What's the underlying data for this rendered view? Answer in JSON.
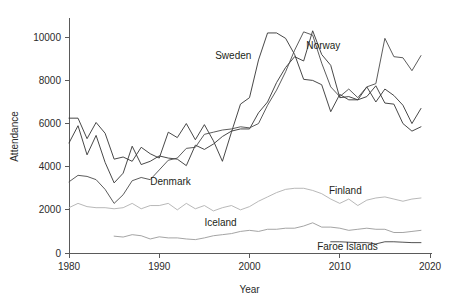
{
  "chart_data": {
    "type": "line",
    "title": "",
    "xlabel": "Year",
    "ylabel": "Attendance",
    "xlim": [
      1980,
      2020
    ],
    "ylim": [
      0,
      10800
    ],
    "grid": false,
    "legend_position": "inline-annotations",
    "xticks": [
      1980,
      1990,
      2000,
      2010,
      2020
    ],
    "xtick_labels": [
      "1980",
      "1990",
      "2000",
      "2010",
      "2020"
    ],
    "yticks": [
      0,
      2000,
      4000,
      6000,
      8000,
      10000
    ],
    "ytick_labels": [
      "0",
      "2000",
      "4000",
      "6000",
      "8000",
      "10000"
    ],
    "series": [
      {
        "name": "Sweden",
        "color": "#333333",
        "label_x": 1996.2,
        "label_y": 9000,
        "x": [
          1980,
          1981,
          1982,
          1983,
          1984,
          1985,
          1986,
          1987,
          1988,
          1989,
          1990,
          1991,
          1992,
          1993,
          1994,
          1995,
          1996,
          1997,
          1998,
          1999,
          2000,
          2001,
          2002,
          2003,
          2004,
          2005,
          2006,
          2007,
          2008,
          2009,
          2010,
          2011,
          2012,
          2013,
          2014,
          2015,
          2016,
          2017,
          2018,
          2019
        ],
        "y": [
          6250,
          6250,
          5300,
          6050,
          5550,
          4350,
          4450,
          4250,
          4900,
          4600,
          4400,
          5600,
          5350,
          6000,
          5250,
          5950,
          5200,
          4250,
          5600,
          6900,
          7200,
          8950,
          10200,
          10200,
          9950,
          9200,
          8050,
          8000,
          7800,
          6550,
          7350,
          7100,
          7100,
          7250,
          7750,
          6950,
          6900,
          6000,
          5650,
          5850
        ]
      },
      {
        "name": "Norway",
        "color": "#333333",
        "label_x": 2006.3,
        "label_y": 9450,
        "x": [
          1980,
          1981,
          1982,
          1983,
          1984,
          1985,
          1986,
          1987,
          1988,
          1989,
          1990,
          1991,
          1992,
          1993,
          1994,
          1995,
          1996,
          1997,
          1998,
          1999,
          2000,
          2001,
          2002,
          2003,
          2004,
          2005,
          2006,
          2007,
          2008,
          2009,
          2010,
          2011,
          2012,
          2013,
          2014,
          2015,
          2016,
          2017,
          2018,
          2019
        ],
        "y": [
          5100,
          5900,
          4550,
          5450,
          4200,
          3250,
          3700,
          4950,
          4100,
          4250,
          4500,
          4400,
          4350,
          4050,
          5000,
          4800,
          5050,
          5400,
          5650,
          5750,
          5750,
          6500,
          7000,
          7900,
          8600,
          9100,
          8900,
          10300,
          9200,
          8700,
          7200,
          7250,
          7100,
          7700,
          7000,
          7600,
          7300,
          6850,
          6000,
          6700
        ]
      },
      {
        "name": "Denmark",
        "color": "#4a4a4a",
        "label_x": 1989.0,
        "label_y": 3150,
        "x": [
          1980,
          1981,
          1982,
          1983,
          1984,
          1985,
          1986,
          1987,
          1988,
          1989,
          1990,
          1991,
          1992,
          1993,
          1994,
          1995,
          1996,
          1997,
          1998,
          1999,
          2000,
          2001,
          2002,
          2003,
          2004,
          2005,
          2006,
          2007,
          2008,
          2009,
          2010,
          2011,
          2012,
          2013,
          2014,
          2015,
          2016,
          2017,
          2018,
          2019
        ],
        "y": [
          3300,
          3600,
          3550,
          3400,
          2950,
          2300,
          2700,
          3350,
          3500,
          3400,
          3850,
          4300,
          4400,
          4850,
          4900,
          5500,
          5600,
          5700,
          5750,
          5850,
          5800,
          6000,
          6850,
          7550,
          8400,
          9400,
          10250,
          10100,
          8800,
          7700,
          7250,
          7600,
          7200,
          7700,
          7850,
          9950,
          9100,
          9050,
          8450,
          9150
        ]
      },
      {
        "name": "Finland",
        "color": "#b0b0b0",
        "label_x": 2008.8,
        "label_y": 2750,
        "x": [
          1980,
          1981,
          1982,
          1983,
          1984,
          1985,
          1986,
          1987,
          1988,
          1989,
          1990,
          1991,
          1992,
          1993,
          1994,
          1995,
          1996,
          1997,
          1998,
          1999,
          2000,
          2001,
          2002,
          2003,
          2004,
          2005,
          2006,
          2007,
          2008,
          2009,
          2010,
          2011,
          2012,
          2013,
          2014,
          2015,
          2016,
          2017,
          2018,
          2019
        ],
        "y": [
          2100,
          2300,
          2150,
          2100,
          2100,
          2050,
          2100,
          2300,
          2050,
          2200,
          2200,
          2300,
          2000,
          2300,
          2050,
          2200,
          1950,
          2100,
          2200,
          2000,
          2150,
          2400,
          2600,
          2800,
          2950,
          3000,
          3000,
          2900,
          2750,
          2500,
          2300,
          2500,
          2200,
          2450,
          2550,
          2600,
          2500,
          2400,
          2500,
          2550
        ]
      },
      {
        "name": "Iceland",
        "color": "#9a9a9a",
        "label_x": 1995.0,
        "label_y": 1250,
        "x": [
          1985,
          1986,
          1987,
          1988,
          1989,
          1990,
          1991,
          1992,
          1993,
          1994,
          1995,
          1996,
          1997,
          1998,
          1999,
          2000,
          2001,
          2002,
          2003,
          2004,
          2005,
          2006,
          2007,
          2008,
          2009,
          2010,
          2011,
          2012,
          2013,
          2014,
          2015,
          2016,
          2017,
          2018,
          2019
        ],
        "y": [
          780,
          740,
          850,
          800,
          650,
          750,
          700,
          700,
          650,
          620,
          700,
          800,
          850,
          900,
          1000,
          1050,
          1000,
          1100,
          1100,
          1150,
          1150,
          1250,
          1400,
          1200,
          1200,
          1150,
          1050,
          1100,
          1150,
          1100,
          1100,
          950,
          950,
          1000,
          1050
        ]
      },
      {
        "name": "Faroe Islands",
        "color": "#3f3f3f",
        "label_x": 2007.5,
        "label_y": 150,
        "x": [
          2009,
          2010,
          2011,
          2012,
          2013,
          2014,
          2015,
          2016,
          2017,
          2018,
          2019
        ],
        "y": [
          520,
          520,
          500,
          480,
          480,
          420,
          520,
          520,
          500,
          480,
          480
        ]
      }
    ]
  }
}
